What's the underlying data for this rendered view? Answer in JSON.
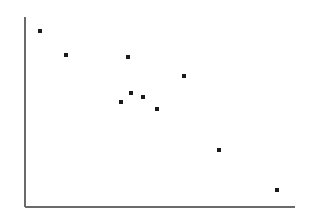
{
  "figure": {
    "width": 311,
    "height": 218,
    "background_color": "#ffffff",
    "axis_color": "#6a6a6a",
    "point_color": "#1a1a1a"
  },
  "chart_data": {
    "type": "scatter",
    "title": "",
    "subtitle": "",
    "xlabel": "",
    "ylabel": "",
    "legend": [],
    "annotations": [],
    "grid": false,
    "xticks": [],
    "yticks": [],
    "xtick_labels": [],
    "ytick_labels": [],
    "xlim": [
      0,
      100
    ],
    "ylim": [
      0,
      100
    ],
    "axes": {
      "y_axis": {
        "x": 25,
        "y_top": 17,
        "y_bottom": 207,
        "width": 2,
        "color": "#6a6a6a"
      },
      "x_axis": {
        "y": 207,
        "x_left": 25,
        "x_right": 295,
        "width": 2,
        "color": "#6a6a6a"
      }
    },
    "marker": {
      "shape": "square",
      "size_px": 3.4,
      "color": "#1a1a1a"
    },
    "pixel_points": [
      {
        "x": 40,
        "y": 31
      },
      {
        "x": 66,
        "y": 55
      },
      {
        "x": 128,
        "y": 57
      },
      {
        "x": 184,
        "y": 76
      },
      {
        "x": 131,
        "y": 93
      },
      {
        "x": 143,
        "y": 97
      },
      {
        "x": 121,
        "y": 102
      },
      {
        "x": 157,
        "y": 109
      },
      {
        "x": 219,
        "y": 150
      },
      {
        "x": 277,
        "y": 190
      }
    ],
    "x": [
      5.6,
      15.2,
      38.1,
      59.3,
      39.3,
      43.7,
      35.6,
      48.9,
      71.9,
      93.3
    ],
    "y": [
      92.6,
      80.0,
      78.9,
      68.9,
      60.0,
      57.9,
      55.3,
      51.6,
      30.0,
      8.9
    ],
    "points": [
      {
        "x": 5.6,
        "y": 92.6
      },
      {
        "x": 15.2,
        "y": 80.0
      },
      {
        "x": 38.1,
        "y": 78.9
      },
      {
        "x": 59.3,
        "y": 68.9
      },
      {
        "x": 39.3,
        "y": 60.0
      },
      {
        "x": 43.7,
        "y": 57.9
      },
      {
        "x": 35.6,
        "y": 55.3
      },
      {
        "x": 48.9,
        "y": 51.6
      },
      {
        "x": 71.9,
        "y": 30.0
      },
      {
        "x": 93.3,
        "y": 8.9
      }
    ],
    "n_points": 10,
    "trend": "decreasing"
  }
}
